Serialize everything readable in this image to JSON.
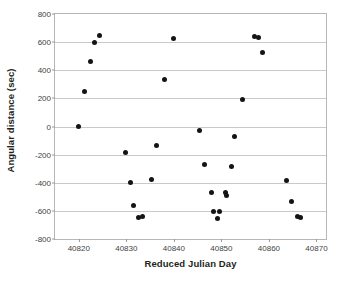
{
  "chart_data": {
    "type": "scatter",
    "title": "",
    "xlabel": "Reduced Julian Day",
    "ylabel": "Angular distance (sec)",
    "xlim": [
      40815,
      40872
    ],
    "ylim": [
      -800,
      800
    ],
    "xticks": [
      40820,
      40830,
      40840,
      40850,
      40860,
      40870
    ],
    "xtick_labels": [
      "40820",
      "40830",
      "40840",
      "40850",
      "40860",
      "40870"
    ],
    "yticks": [
      800,
      600,
      400,
      200,
      0,
      -200,
      -400,
      -600,
      -800
    ],
    "ytick_labels": [
      "800",
      "600",
      "400",
      "200",
      "0",
      "-200",
      "-400",
      "-600",
      "-800"
    ],
    "grid": "horizontal",
    "legend": "none",
    "marker": {
      "shape": "circle",
      "color": "#141414",
      "size": 5
    },
    "series": [
      {
        "name": "Angular distance",
        "points": [
          [
            40820.0,
            0
          ],
          [
            40821.2,
            250
          ],
          [
            40822.4,
            460
          ],
          [
            40823.3,
            597
          ],
          [
            40824.3,
            650
          ],
          [
            40829.8,
            -185
          ],
          [
            40830.9,
            -398
          ],
          [
            40831.6,
            -565
          ],
          [
            40832.6,
            -645
          ],
          [
            40833.3,
            -642
          ],
          [
            40835.4,
            -380
          ],
          [
            40836.3,
            -135
          ],
          [
            40838.0,
            335
          ],
          [
            40840.0,
            625
          ],
          [
            40845.4,
            -30
          ],
          [
            40846.5,
            -268
          ],
          [
            40847.9,
            -470
          ],
          [
            40848.3,
            -602
          ],
          [
            40849.1,
            -655
          ],
          [
            40849.7,
            -602
          ],
          [
            40850.9,
            -472
          ],
          [
            40851.0,
            -492
          ],
          [
            40852.2,
            -283
          ],
          [
            40852.7,
            -70
          ],
          [
            40854.5,
            193
          ],
          [
            40856.9,
            640
          ],
          [
            40857.9,
            632
          ],
          [
            40858.6,
            523
          ],
          [
            40863.7,
            -385
          ],
          [
            40864.8,
            -530
          ],
          [
            40866.0,
            -638
          ],
          [
            40866.6,
            -648
          ]
        ]
      }
    ]
  }
}
